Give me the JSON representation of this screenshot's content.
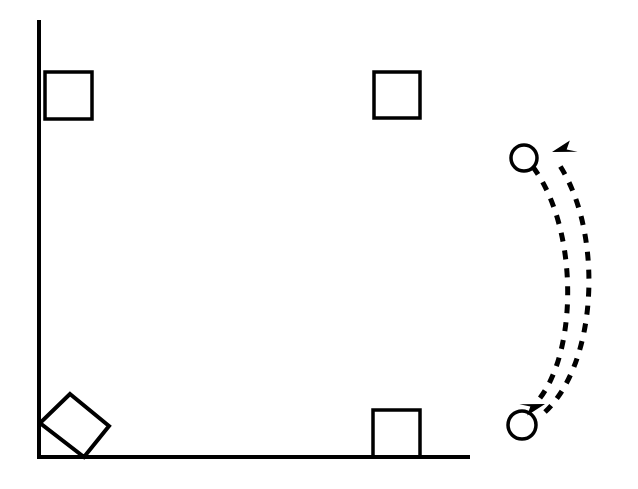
{
  "figure": {
    "title": "",
    "background_color": "#ffffff",
    "stroke_color": "#000000",
    "width": 638,
    "height": 489
  },
  "axes": {
    "name": "corner-axes",
    "stroke_color": "#000000",
    "stroke_width": 4,
    "vertical": {
      "x": 39,
      "y_top": 22,
      "y_bottom": 457
    },
    "horizontal": {
      "y": 457,
      "x_left": 39,
      "x_right": 468
    }
  },
  "squares": [
    {
      "id": "square-top-left",
      "label": "",
      "x": 45,
      "y": 72,
      "width": 47,
      "height": 47,
      "rotation": 0,
      "stroke_width": 3.5,
      "fill": "none",
      "attached_to": "vertical-axis"
    },
    {
      "id": "square-top-right",
      "label": "",
      "x": 374,
      "y": 72,
      "width": 46,
      "height": 46,
      "rotation": 0,
      "stroke_width": 3.5,
      "fill": "none",
      "attached_to": "none"
    },
    {
      "id": "square-bottom-right",
      "label": "",
      "x": 373,
      "y": 410,
      "width": 47,
      "height": 47,
      "rotation": 0,
      "stroke_width": 3.5,
      "fill": "none",
      "attached_to": "horizontal-axis"
    }
  ],
  "rotated_square": {
    "id": "square-bottom-left-rotated",
    "label": "",
    "rotation_degrees": 40,
    "stroke_width": 4,
    "fill": "none",
    "points": "70,394 109,426 84,457 40,423",
    "attached_to": "axes-corner"
  },
  "circles": [
    {
      "id": "circle-top",
      "label": "",
      "cx": 524,
      "cy": 158,
      "r": 13,
      "stroke_width": 3.5,
      "fill": "none"
    },
    {
      "id": "circle-bottom",
      "label": "",
      "cx": 522,
      "cy": 425,
      "r": 14,
      "stroke_width": 3.5,
      "fill": "none"
    }
  ],
  "arrows": [
    {
      "id": "arc-arrow-upward",
      "label": "",
      "direction": "up",
      "style": "dashed",
      "dash_pattern": "9 9",
      "stroke_width": 5,
      "path": "M 545 412 C 600 360, 603 225, 556 160",
      "arrowhead_at": {
        "x": 556,
        "y": 160
      },
      "arrowhead_angle": -52
    },
    {
      "id": "arc-arrow-downward",
      "label": "",
      "direction": "down",
      "style": "dashed",
      "dash_pattern": "9 9",
      "stroke_width": 5,
      "path": "M 533 167 C 578 228, 578 348, 540 398",
      "arrowhead_at": {
        "x": 540,
        "y": 398
      },
      "arrowhead_angle": 128
    }
  ]
}
